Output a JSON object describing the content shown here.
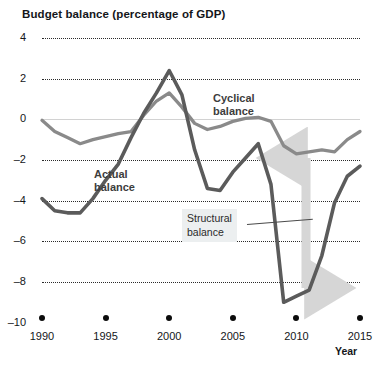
{
  "chart_data": {
    "type": "line",
    "title": "Budget balance (percentage of GDP)",
    "xlabel": "Year",
    "ylabel": "",
    "xlim": [
      1990,
      2015
    ],
    "ylim": [
      -10,
      4
    ],
    "grid": true,
    "legend_position": "inline-annotations",
    "xticks": [
      1990,
      1995,
      2000,
      2005,
      2010,
      2015
    ],
    "yticks": [
      4,
      2,
      0,
      -2,
      -4,
      -6,
      -8,
      -10
    ],
    "annotations": [
      {
        "id": "cyclical",
        "text": "Cyclical\nbalance",
        "line1": "Cyclical",
        "line2": "balance"
      },
      {
        "id": "actual",
        "text": "Actual\nbalance",
        "line1": "Actual",
        "line2": "balance"
      },
      {
        "id": "structural",
        "text": "Structural\nbalance",
        "line1": "Structural",
        "line2": "balance",
        "style": "boxed-with-leader-line"
      },
      {
        "id": "gap-arrow",
        "text": "",
        "style": "double-headed-vertical-arrow",
        "x": 2010,
        "y_top": -1.5,
        "y_bottom": -8.4,
        "color": "#d6d6d6"
      }
    ],
    "series": [
      {
        "name": "Actual balance",
        "color": "#5b5b5b",
        "x": [
          1990,
          1991,
          1992,
          1993,
          1994,
          1995,
          1996,
          1997,
          1998,
          1999,
          2000,
          2001,
          2002,
          2003,
          2004,
          2005,
          2006,
          2007,
          2008,
          2009,
          2010,
          2011,
          2012,
          2013,
          2014,
          2015
        ],
        "values": [
          -3.9,
          -4.5,
          -4.6,
          -4.6,
          -3.9,
          -3.0,
          -2.2,
          -0.9,
          0.3,
          1.3,
          2.4,
          1.2,
          -1.5,
          -3.4,
          -3.5,
          -2.6,
          -1.9,
          -1.2,
          -3.2,
          -9.0,
          -8.7,
          -8.4,
          -6.7,
          -4.1,
          -2.8,
          -2.3
        ]
      },
      {
        "name": "Cyclical balance",
        "color": "#8a8a8a",
        "x": [
          1990,
          1991,
          1992,
          1993,
          1994,
          1995,
          1996,
          1997,
          1998,
          1999,
          2000,
          2001,
          2002,
          2003,
          2004,
          2005,
          2006,
          2007,
          2008,
          2009,
          2010,
          2011,
          2012,
          2013,
          2014,
          2015
        ],
        "values": [
          -0.05,
          -0.6,
          -0.9,
          -1.2,
          -1.0,
          -0.85,
          -0.7,
          -0.6,
          0.2,
          0.9,
          1.3,
          0.6,
          -0.2,
          -0.5,
          -0.35,
          -0.1,
          0.05,
          0.1,
          -0.1,
          -1.3,
          -1.7,
          -1.6,
          -1.5,
          -1.6,
          -1.0,
          -0.6
        ]
      }
    ]
  },
  "axis": {
    "y_tick_labels": [
      "4",
      "2",
      "0",
      "–2",
      "–4",
      "–6",
      "–8",
      "–10"
    ],
    "x_tick_labels": [
      "1990",
      "1995",
      "2000",
      "2005",
      "2010",
      "2015"
    ],
    "x_axis_title": "Year"
  },
  "labels": {
    "cyclical_line1": "Cyclical",
    "cyclical_line2": "balance",
    "actual_line1": "Actual",
    "actual_line2": "balance",
    "structural_line1": "Structural",
    "structural_line2": "balance"
  },
  "colors": {
    "actual_line": "#5b5b5b",
    "cyclical_line": "#8a8a8a",
    "arrow": "#d6d6d6",
    "grid": "#2b2b2b",
    "zero_line": "#d2d2d2"
  }
}
